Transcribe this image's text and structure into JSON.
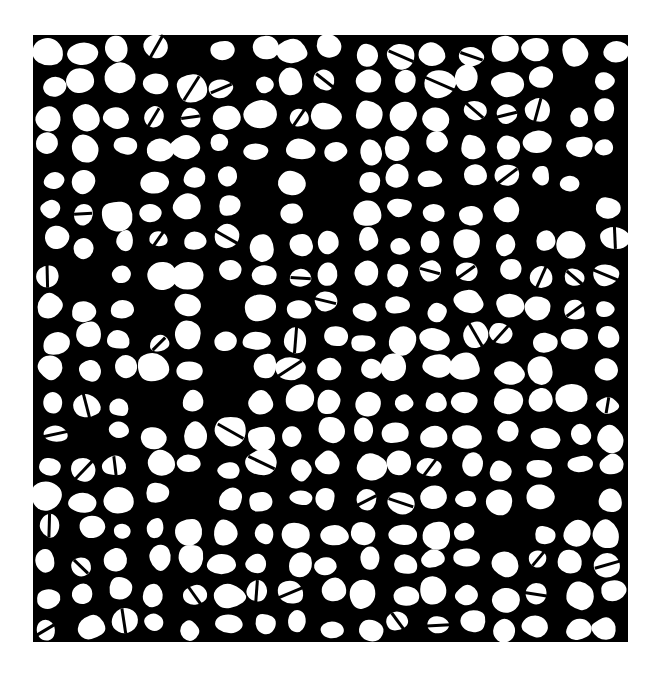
{
  "image": {
    "description": "Binarized micrograph of a cellular/foam-like structure: white polygonal cells separated by a black network",
    "background_color": "#ffffff",
    "network_color": "#000000",
    "cell_color": "#ffffff",
    "pattern_bounds": {
      "x": 33,
      "y": 35,
      "width": 595,
      "height": 607
    },
    "approx_cell_rows": 19,
    "approx_cell_cols": 17
  }
}
